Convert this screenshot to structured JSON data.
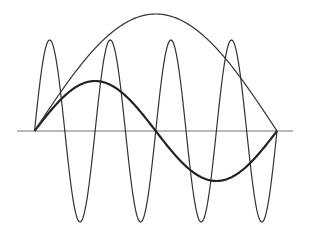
{
  "diagram": {
    "type": "wave-superposition",
    "colors": {
      "background": "#ffffff",
      "axis": "#777777",
      "stroke": "#333333",
      "bold_stroke": "#222222"
    },
    "axis": {
      "x1": 17,
      "x2": 293,
      "y": 131
    },
    "span": {
      "x_start": 34.5,
      "x_end": 277
    },
    "waves": [
      {
        "name": "high-frequency-wave",
        "cycles": 4,
        "amplitude": 91,
        "stroke_width": 1.2
      },
      {
        "name": "fundamental-wave",
        "cycles": 1,
        "amplitude": 50,
        "stroke_width": 2.2
      },
      {
        "name": "half-wave-arc",
        "cycles": 0.5,
        "amplitude": 117,
        "stroke_width": 1.2
      }
    ]
  }
}
